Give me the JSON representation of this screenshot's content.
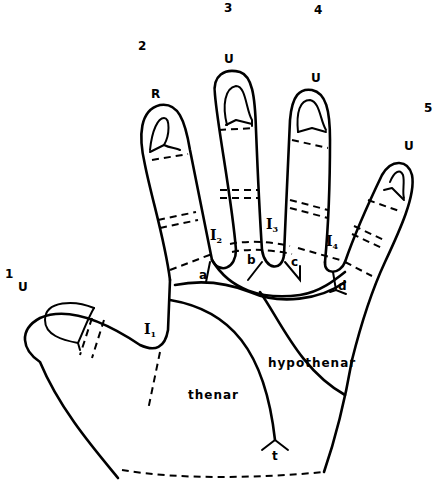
{
  "diagram": {
    "digit_numbers": [
      {
        "id": "1",
        "x": 5,
        "y": 278
      },
      {
        "id": "2",
        "x": 138,
        "y": 50
      },
      {
        "id": "3",
        "x": 224,
        "y": 12
      },
      {
        "id": "4",
        "x": 314,
        "y": 14
      },
      {
        "id": "5",
        "x": 424,
        "y": 112
      }
    ],
    "fingertip_patterns": [
      {
        "digit": "1",
        "label": "U"
      },
      {
        "digit": "2",
        "label": "R"
      },
      {
        "digit": "3",
        "label": "U"
      },
      {
        "digit": "4",
        "label": "U"
      },
      {
        "digit": "5",
        "label": "U"
      }
    ],
    "interdigital_areas": [
      {
        "label": "I",
        "sub": "1"
      },
      {
        "label": "I",
        "sub": "2"
      },
      {
        "label": "I",
        "sub": "3"
      },
      {
        "label": "I",
        "sub": "4"
      }
    ],
    "triradii": [
      "a",
      "b",
      "c",
      "d",
      "t"
    ],
    "regions": {
      "thenar": "thenar",
      "hypothenar": "hypothenar"
    }
  }
}
